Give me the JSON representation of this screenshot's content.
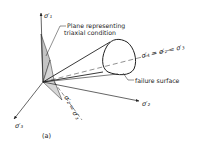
{
  "figure": {
    "caption": "(a)",
    "colors": {
      "ink": "#222222",
      "plane_fill": "#bdbdbd",
      "background": "#ffffff"
    },
    "axes": [
      {
        "name": "sigma1-axis",
        "label": "σ′₁",
        "label_x": 44,
        "label_y": 18
      },
      {
        "name": "sigma2-axis",
        "label": "σ′₂",
        "label_x": 143,
        "label_y": 104
      },
      {
        "name": "sigma3-axis",
        "label": "σ′₃",
        "label_x": 16,
        "label_y": 127
      }
    ],
    "annotations": {
      "plane": [
        "Plane representing",
        "triaxial condition"
      ],
      "space_diagonal": "σ′₁ = σ′₂ = σ′₃",
      "failure_surface": "failure surface",
      "plane_trace": "σ′₂ = σ′₃"
    }
  }
}
